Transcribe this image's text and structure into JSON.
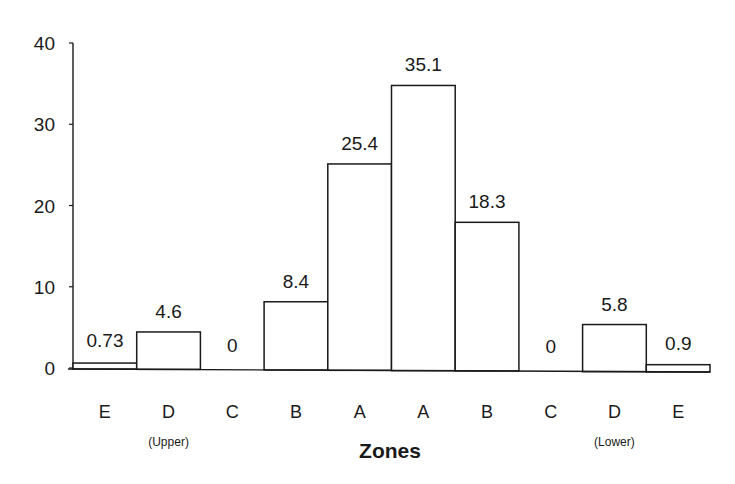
{
  "chart_data": {
    "type": "bar",
    "title": "",
    "xlabel": "Zones",
    "ylabel": "",
    "ylim": [
      0,
      40
    ],
    "yticks": [
      0,
      10,
      20,
      30,
      40
    ],
    "grid": false,
    "legend": null,
    "categories": [
      "E",
      "D",
      "C",
      "B",
      "A",
      "A",
      "B",
      "C",
      "D",
      "E"
    ],
    "values": [
      0.73,
      4.6,
      0,
      8.4,
      25.4,
      35.1,
      18.3,
      0,
      5.8,
      0.9
    ],
    "value_labels": [
      "0.73",
      "4.6",
      "0",
      "8.4",
      "25.4",
      "35.1",
      "18.3",
      "0",
      "5.8",
      "0.9"
    ],
    "group_annotations": [
      {
        "text": "(Upper)",
        "under_category_index": 1
      },
      {
        "text": "(Lower)",
        "under_category_index": 8
      }
    ]
  },
  "colors": {
    "ink": "#1a1a1a",
    "bar_fill": "#ffffff",
    "background": "#ffffff"
  }
}
